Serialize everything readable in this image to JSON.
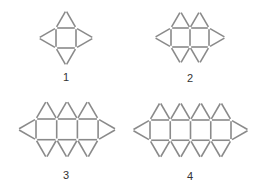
{
  "figures": [
    {
      "label": "1",
      "squares": 1,
      "x0": 56,
      "y0": 28,
      "side": 20,
      "labelX": 66,
      "labelY": 71
    },
    {
      "label": "2",
      "squares": 2,
      "x0": 171,
      "y0": 28,
      "side": 19,
      "labelX": 190,
      "labelY": 72
    },
    {
      "label": "3",
      "squares": 3,
      "x0": 36,
      "y0": 119,
      "side": 20.7,
      "labelX": 66,
      "labelY": 169
    },
    {
      "label": "4",
      "squares": 4,
      "x0": 150,
      "y0": 120,
      "side": 20.25,
      "labelX": 190,
      "labelY": 170
    }
  ],
  "style": {
    "stroke": "#8a8a8a",
    "strokeWidth": 1.6
  }
}
